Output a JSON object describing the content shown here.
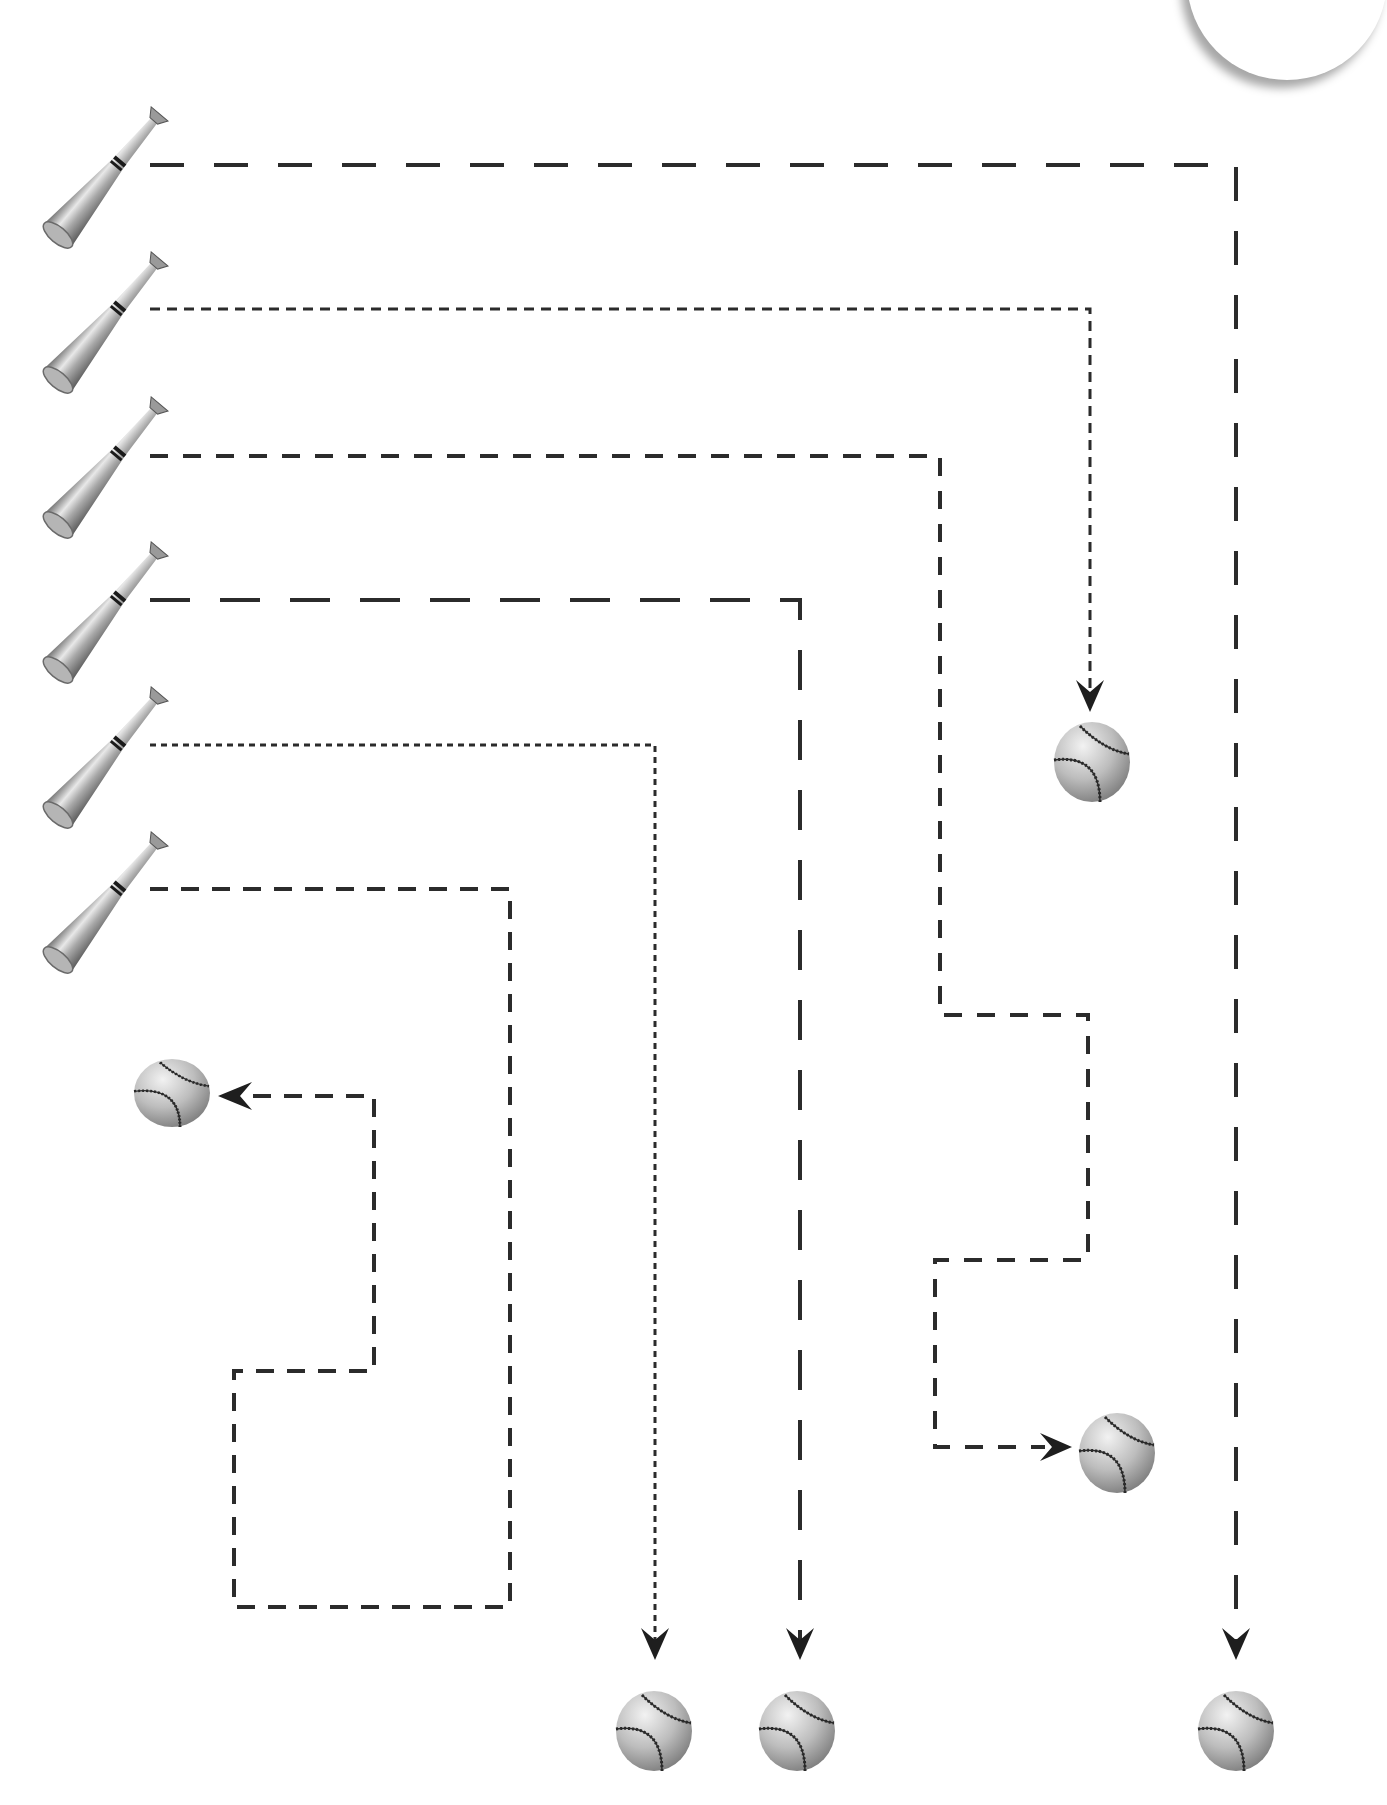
{
  "worksheet": {
    "title": "Baseball bat to ball tracing lines",
    "stroke_color": "#2b2b2b",
    "background": "#ffffff"
  },
  "bats": [
    {
      "id": 1,
      "x": 40,
      "y": 80
    },
    {
      "id": 2,
      "x": 40,
      "y": 224
    },
    {
      "id": 3,
      "x": 40,
      "y": 370
    },
    {
      "id": 4,
      "x": 40,
      "y": 514
    },
    {
      "id": 5,
      "x": 40,
      "y": 659
    },
    {
      "id": 6,
      "x": 40,
      "y": 803
    }
  ],
  "paths": [
    {
      "id": 1,
      "style": "long-dash",
      "points": "150,165 1236,165 1236,1640",
      "arrow": "down",
      "arrow_tip": [
        1236,
        1657
      ]
    },
    {
      "id": 2,
      "style": "short-dash",
      "points": "150,309 1090,309 1090,690",
      "arrow": "down",
      "arrow_tip": [
        1090,
        710
      ]
    },
    {
      "id": 3,
      "style": "medium-dash",
      "points": "150,456 940,456 940,1015 1088,1015 1088,1260 935,1260 935,1447 1040,1447",
      "arrow": "right",
      "arrow_tip": [
        1068,
        1447
      ]
    },
    {
      "id": 4,
      "style": "long-dash",
      "points": "150,600 800,600 800,1640",
      "arrow": "down",
      "arrow_tip": [
        798,
        1657
      ]
    },
    {
      "id": 5,
      "style": "dotted",
      "points": "150,745 655,745 655,1640",
      "arrow": "down",
      "arrow_tip": [
        654,
        1657
      ]
    },
    {
      "id": 6,
      "style": "medium-dash",
      "points": "150,889 510,889 510,1607 234,1607 234,1371 374,1371 374,1096 245,1096",
      "arrow": "left",
      "arrow_tip": [
        219,
        1096
      ]
    }
  ],
  "balls": [
    {
      "id": 1,
      "cx": 1236,
      "cy": 1731
    },
    {
      "id": 2,
      "cx": 1092,
      "cy": 762
    },
    {
      "id": 3,
      "cx": 1117,
      "cy": 1453
    },
    {
      "id": 4,
      "cx": 797,
      "cy": 1731
    },
    {
      "id": 5,
      "cx": 654,
      "cy": 1731
    },
    {
      "id": 6,
      "cx": 172,
      "cy": 1093
    }
  ]
}
